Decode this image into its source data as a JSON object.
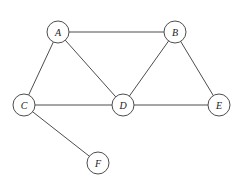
{
  "diagram": {
    "background_color": "#ffffff",
    "stroke_color": "#4d4d4d",
    "node_fill_color": "#ffffff",
    "label_color": "#1a1a1a",
    "node_radius": 11,
    "nodes": [
      {
        "id": "A",
        "label": "A",
        "x": 58,
        "y": 32
      },
      {
        "id": "B",
        "label": "B",
        "x": 175,
        "y": 32
      },
      {
        "id": "C",
        "label": "C",
        "x": 24,
        "y": 105
      },
      {
        "id": "D",
        "label": "D",
        "x": 123,
        "y": 105
      },
      {
        "id": "E",
        "label": "E",
        "x": 219,
        "y": 105
      },
      {
        "id": "F",
        "label": "F",
        "x": 98,
        "y": 163
      }
    ],
    "edges": [
      {
        "from": "A",
        "to": "B"
      },
      {
        "from": "A",
        "to": "C"
      },
      {
        "from": "A",
        "to": "D"
      },
      {
        "from": "B",
        "to": "D"
      },
      {
        "from": "B",
        "to": "E"
      },
      {
        "from": "C",
        "to": "D"
      },
      {
        "from": "C",
        "to": "F"
      },
      {
        "from": "D",
        "to": "E"
      }
    ]
  }
}
